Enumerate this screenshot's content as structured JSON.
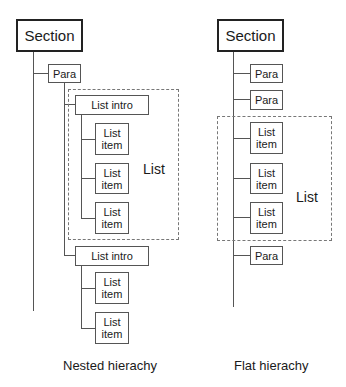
{
  "nested": {
    "section": "Section",
    "para": "Para",
    "list_intro_1": "List intro",
    "list_intro_2": "List intro",
    "list_item_line1": "List",
    "list_item_line2": "item",
    "list_label": "List",
    "caption": "Nested hierachy"
  },
  "flat": {
    "section": "Section",
    "para": "Para",
    "list_item_line1": "List",
    "list_item_line2": "item",
    "list_label": "List",
    "caption": "Flat hierachy"
  }
}
